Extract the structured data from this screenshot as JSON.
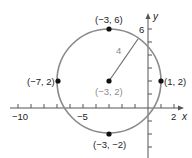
{
  "figure": {
    "x_axis": {
      "label": "x",
      "tick_labels": {
        "neg10": "-10",
        "neg5": "-5",
        "pos2": "2"
      }
    },
    "y_axis": {
      "label": "y",
      "tick_labels": {
        "pos6": "6"
      }
    },
    "circle": {
      "center_label": "(-3, 2)",
      "radius_label": "4",
      "points": {
        "top": "(-3, 6)",
        "bottom": "(-3, -2)",
        "left": "(-7, 2)",
        "right": "(1, 2)"
      }
    },
    "colors": {
      "circle": "#8a8a8a",
      "axis": "#555555",
      "point": "#111111",
      "text": "#222222",
      "muted_text": "#8c8c8c"
    }
  }
}
